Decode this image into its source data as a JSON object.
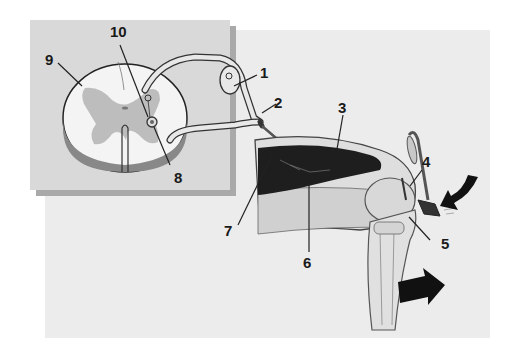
{
  "diagram": {
    "colors": {
      "background": "#ffffff",
      "outer_panel": "#ececec",
      "inset_panel": "#d9d9d9",
      "inset_shadow": "#a9a9a9",
      "gray_matter": "#b9b9b9",
      "muscle": "#222222",
      "leg": "#d6d6d6",
      "arrow": "#111111"
    },
    "labels": [
      {
        "id": "1",
        "text": "1"
      },
      {
        "id": "2",
        "text": "2"
      },
      {
        "id": "3",
        "text": "3"
      },
      {
        "id": "4",
        "text": "4"
      },
      {
        "id": "5",
        "text": "5"
      },
      {
        "id": "6",
        "text": "6"
      },
      {
        "id": "7",
        "text": "7"
      },
      {
        "id": "8",
        "text": "8"
      },
      {
        "id": "9",
        "text": "9"
      },
      {
        "id": "10",
        "text": "10"
      }
    ]
  }
}
